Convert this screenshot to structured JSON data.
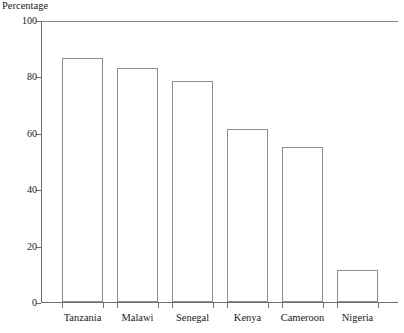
{
  "chart_data": {
    "type": "bar",
    "title": "",
    "xlabel": "",
    "ylabel": "Percentage",
    "ylim": [
      0,
      100
    ],
    "yticks": [
      0,
      20,
      40,
      60,
      80,
      100
    ],
    "grid": false,
    "legend": null,
    "categories": [
      "Tanzania",
      "Malawi",
      "Senegal",
      "Kenya",
      "Cameroon",
      "Nigeria"
    ],
    "values": [
      86.5,
      83,
      78.5,
      61.5,
      55,
      11.5
    ],
    "bar_style": {
      "fill": "#ffffff",
      "edge": "#8d8d8d"
    }
  }
}
